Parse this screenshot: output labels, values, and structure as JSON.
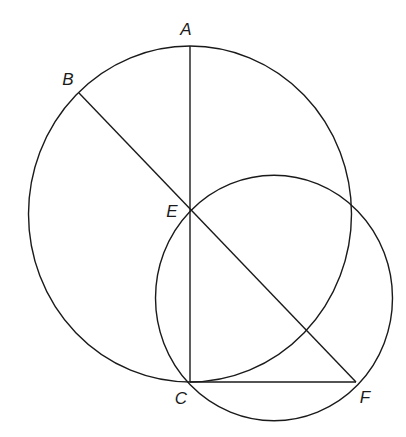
{
  "diagram": {
    "stroke_color": "#1a1a1a",
    "background": "#ffffff",
    "circles": [
      {
        "name": "large-circle",
        "cx": 190,
        "cy": 214,
        "rx": 161.5,
        "ry": 168
      },
      {
        "name": "small-circle",
        "cx": 274,
        "cy": 298,
        "rx": 118.5,
        "ry": 122.7
      }
    ],
    "points": {
      "A": {
        "x": 190,
        "y": 46
      },
      "B": {
        "x": 79,
        "y": 93
      },
      "C": {
        "x": 190,
        "y": 382
      },
      "E": {
        "x": 190,
        "y": 210
      },
      "F": {
        "x": 356,
        "y": 382
      }
    },
    "segments": [
      {
        "name": "segment-AC",
        "from": "A",
        "to": "C"
      },
      {
        "name": "segment-BF",
        "from": "B",
        "to": "F"
      },
      {
        "name": "segment-CF",
        "from": "C",
        "to": "F"
      }
    ],
    "labels": [
      {
        "text": "A",
        "x": 186,
        "y": 31
      },
      {
        "text": "B",
        "x": 68,
        "y": 81
      },
      {
        "text": "E",
        "x": 172,
        "y": 213
      },
      {
        "text": "C",
        "x": 181,
        "y": 400
      },
      {
        "text": "F",
        "x": 365,
        "y": 399
      }
    ]
  }
}
